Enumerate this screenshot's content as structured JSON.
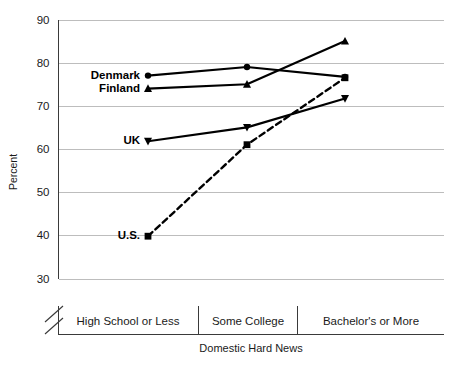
{
  "chart_data": {
    "type": "line",
    "title": "",
    "xlabel": "Domestic Hard News",
    "ylabel": "Percent",
    "categories": [
      "High School or Less",
      "Some College",
      "Bachelor's or More"
    ],
    "ylim": [
      30,
      90
    ],
    "yticks": [
      30,
      40,
      50,
      60,
      70,
      80,
      90
    ],
    "ytick_labels": [
      "30",
      "40",
      "50",
      "60",
      "70",
      "80",
      "90"
    ],
    "grid": true,
    "legend_position": "inline-left-labels",
    "y_axis_break": true,
    "series": [
      {
        "name": "Denmark",
        "label": "Denmark",
        "marker": "circle",
        "linestyle": "solid",
        "color": "#000000",
        "values": [
          77.0,
          79.0,
          76.7
        ]
      },
      {
        "name": "Finland",
        "label": "Finland",
        "marker": "triangle-up",
        "linestyle": "solid",
        "color": "#000000",
        "values": [
          74.0,
          75.0,
          85.0
        ]
      },
      {
        "name": "UK",
        "label": "UK",
        "marker": "triangle-down",
        "linestyle": "solid",
        "color": "#000000",
        "values": [
          61.8,
          65.0,
          71.7
        ]
      },
      {
        "name": "U.S.",
        "label": "U.S.",
        "marker": "square",
        "linestyle": "dashed",
        "color": "#000000",
        "values": [
          39.8,
          61.0,
          76.5
        ]
      }
    ]
  },
  "axis": {
    "y_title": "Percent",
    "x_title": "Domestic Hard News"
  },
  "colors": {
    "gridline": "#bdbdbd",
    "axis": "#3a3a3a",
    "series": "#000000",
    "background": "#ffffff"
  }
}
